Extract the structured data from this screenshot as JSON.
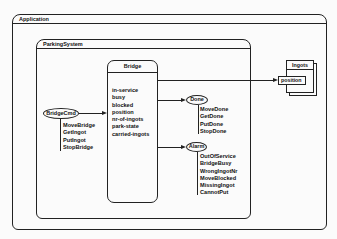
{
  "application": {
    "title": "Application"
  },
  "parking_system": {
    "title": "ParkingSystem"
  },
  "bridge": {
    "title": "Bridge",
    "attributes": [
      "in-service",
      "busy",
      "blocked",
      "position",
      "nr-of-ingots",
      "park-state",
      "carried-ingots"
    ]
  },
  "bridge_cmd": {
    "label": "BridgeCmd",
    "items": [
      "MoveBridge",
      "GetIngot",
      "PutIngot",
      "StopBridge"
    ]
  },
  "done": {
    "label": "Done",
    "items": [
      "MoveDone",
      "GetDone",
      "PutDone",
      "StopDone"
    ]
  },
  "alarm": {
    "label": "Alarm",
    "items": [
      "OutOfService",
      "BridgeBusy",
      "WrongIngotNr",
      "MoveBlocked",
      "MissingIngot",
      "CannotPut"
    ]
  },
  "ingots": {
    "title": "Ingots",
    "attribute": "position"
  }
}
